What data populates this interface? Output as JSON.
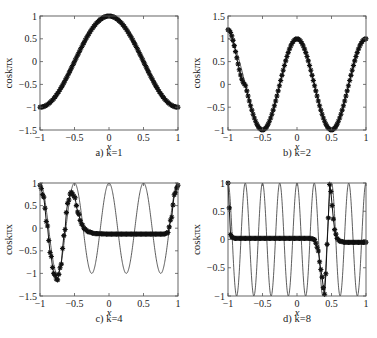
{
  "figure": {
    "ylabel": "coskπx",
    "xlabel": "x"
  },
  "chart_data": [
    {
      "type": "line",
      "panel": "a",
      "caption": "a) k=1",
      "k": 1,
      "xlabel": "x",
      "ylabel": "coskπx",
      "xlim": [
        -1,
        1
      ],
      "ylim": [
        -1.5,
        1
      ],
      "xticks": [
        "-1",
        "-0.5",
        "0",
        "0.5",
        "1"
      ],
      "yticks": [
        "-1.5",
        "-1",
        "-0.5",
        "0",
        "0.5",
        "1"
      ],
      "grid": false,
      "series": [
        {
          "name": "exact cos(kπx)",
          "style": "thin line",
          "function": "cos(1*pi*x)"
        },
        {
          "name": "approximation",
          "style": "star markers",
          "x": [
            -1,
            -0.75,
            -0.5,
            -0.25,
            0,
            0.25,
            0.5,
            0.75,
            1
          ],
          "values": [
            -1,
            -0.71,
            0,
            0.71,
            1,
            0.71,
            0,
            -0.71,
            -1
          ]
        }
      ]
    },
    {
      "type": "line",
      "panel": "b",
      "caption": "b) k=2",
      "k": 2,
      "xlabel": "x",
      "ylabel": "coskπx",
      "xlim": [
        -1,
        1
      ],
      "ylim": [
        -1,
        1.5
      ],
      "xticks": [
        "-1",
        "-0.5",
        "0",
        "0.5",
        "1"
      ],
      "yticks": [
        "-1",
        "-0.5",
        "0",
        "0.5",
        "1",
        "1.5"
      ],
      "grid": false,
      "series": [
        {
          "name": "exact cos(kπx)",
          "style": "thin line",
          "function": "cos(2*pi*x)"
        },
        {
          "name": "approximation",
          "style": "star markers",
          "x": [
            -1,
            -0.75,
            -0.5,
            -0.25,
            0,
            0.25,
            0.5,
            0.75,
            1
          ],
          "values": [
            1.2,
            0,
            -1,
            0,
            1,
            0,
            -1,
            0,
            1
          ]
        }
      ]
    },
    {
      "type": "line",
      "panel": "c",
      "caption": "c) k=4",
      "k": 4,
      "xlabel": "x",
      "ylabel": "coskπx",
      "xlim": [
        -1,
        1
      ],
      "ylim": [
        -1.5,
        1
      ],
      "xticks": [
        "-1",
        "-0.5",
        "0",
        "0.5",
        "1"
      ],
      "yticks": [
        "-1.5",
        "-1",
        "-0.5",
        "0",
        "0.5",
        "1"
      ],
      "grid": false,
      "series": [
        {
          "name": "exact cos(kπx)",
          "style": "thin line",
          "function": "cos(4*pi*x)"
        },
        {
          "name": "approximation",
          "style": "star markers",
          "x": [
            -1,
            -0.95,
            -0.9,
            -0.85,
            -0.8,
            -0.75,
            -0.7,
            -0.65,
            -0.6,
            -0.55,
            -0.5,
            -0.45,
            -0.4,
            -0.35,
            -0.3,
            -0.2,
            0,
            0.2,
            0.4,
            0.6,
            0.8,
            0.85,
            0.9,
            0.95,
            1
          ],
          "values": [
            0.95,
            0.7,
            0.1,
            -0.55,
            -1.0,
            -1.15,
            -0.85,
            -0.15,
            0.55,
            0.8,
            0.7,
            0.35,
            0.1,
            -0.02,
            -0.08,
            -0.12,
            -0.13,
            -0.13,
            -0.13,
            -0.13,
            -0.13,
            -0.1,
            0.2,
            0.75,
            0.95
          ]
        }
      ]
    },
    {
      "type": "line",
      "panel": "d",
      "caption": "d) k=8",
      "k": 8,
      "xlabel": "x",
      "ylabel": "coskπx",
      "xlim": [
        -1,
        1
      ],
      "ylim": [
        -1,
        1
      ],
      "xticks": [
        "-1",
        "-0.5",
        "0",
        "0.5",
        "1"
      ],
      "yticks": [
        "-1",
        "-0.5",
        "0",
        "0.5",
        "1"
      ],
      "grid": false,
      "series": [
        {
          "name": "exact cos(kπx)",
          "style": "thin line",
          "function": "cos(8*pi*x)"
        },
        {
          "name": "approximation",
          "style": "star markers",
          "x": [
            -1,
            -0.98,
            -0.96,
            -0.9,
            -0.5,
            0,
            0.2,
            0.25,
            0.3,
            0.33,
            0.36,
            0.38,
            0.4,
            0.42,
            0.45,
            0.47,
            0.49,
            0.51,
            0.53,
            0.55,
            0.58,
            0.62,
            0.7,
            0.85,
            1
          ],
          "values": [
            1.0,
            0.55,
            0.05,
            0.02,
            0.02,
            0.02,
            0.02,
            0.0,
            -0.15,
            -0.4,
            -0.65,
            -0.85,
            -0.97,
            -0.6,
            0.3,
            0.98,
            0.85,
            0.6,
            0.35,
            0.15,
            0.02,
            -0.03,
            -0.05,
            -0.05,
            -0.05
          ]
        }
      ]
    }
  ]
}
